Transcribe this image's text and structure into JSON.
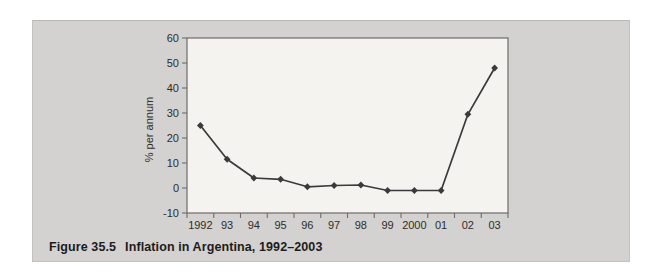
{
  "panel": {
    "background": "#d3d2d0"
  },
  "caption": {
    "label": "Figure 35.5",
    "title": "Inflation in Argentina, 1992–2003"
  },
  "chart_data": {
    "type": "line",
    "categories": [
      "1992",
      "93",
      "94",
      "95",
      "96",
      "97",
      "98",
      "99",
      "2000",
      "01",
      "02",
      "03"
    ],
    "series": [
      {
        "name": "Inflation",
        "values": [
          25,
          11.5,
          4,
          3.5,
          0.5,
          1,
          1.2,
          -1,
          -1,
          -1,
          29.5,
          48
        ]
      }
    ],
    "title": "",
    "xlabel": "",
    "ylabel": "% per annum",
    "ylim": [
      -10,
      60
    ],
    "ytick_step": 10,
    "grid": false,
    "legend": "none",
    "marker": "diamond",
    "line_color": "#3a3a3a",
    "marker_color": "#3a3a3a",
    "plot_bg": "#f4f3ef",
    "axis_color": "#6e6c68",
    "tick_label_color": "#2e2d2b"
  }
}
